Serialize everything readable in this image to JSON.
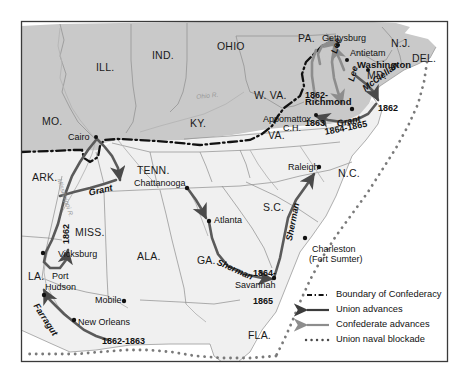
{
  "figure": {
    "kind": "historical-map",
    "frame_color": "#3a3a3a",
    "union_fill": "#c9c9c9",
    "confederacy_fill": "#f0f0f0",
    "arrow_color": "#4a4a4a",
    "water_color": "#ffffff",
    "border_color": "#7d7d7d",
    "text_color": "#111111"
  },
  "states": [
    {
      "id": "il",
      "label": "ILL.",
      "x": 96,
      "y": 62,
      "size": "lg"
    },
    {
      "id": "in",
      "label": "IND.",
      "x": 152,
      "y": 50,
      "size": "lg"
    },
    {
      "id": "oh",
      "label": "OHIO",
      "x": 217,
      "y": 41,
      "size": "lg"
    },
    {
      "id": "pa",
      "label": "PA.",
      "x": 298,
      "y": 33,
      "size": "lg"
    },
    {
      "id": "nj",
      "label": "N.J.",
      "x": 391,
      "y": 38,
      "size": "lg"
    },
    {
      "id": "del",
      "label": "DEL.",
      "x": 412,
      "y": 53,
      "size": "lg"
    },
    {
      "id": "md",
      "label": "MD.",
      "x": 367,
      "y": 70,
      "size": "lg"
    },
    {
      "id": "mo",
      "label": "MO.",
      "x": 42,
      "y": 116,
      "size": "lg"
    },
    {
      "id": "ky",
      "label": "KY.",
      "x": 190,
      "y": 118,
      "size": "lg"
    },
    {
      "id": "wva",
      "label": "W. VA.",
      "x": 254,
      "y": 90,
      "size": "lg"
    },
    {
      "id": "va",
      "label": "VA.",
      "x": 268,
      "y": 130,
      "size": "lg"
    },
    {
      "id": "ark",
      "label": "ARK.",
      "x": 32,
      "y": 172,
      "size": "lg"
    },
    {
      "id": "tenn",
      "label": "TENN.",
      "x": 137,
      "y": 165,
      "size": "lg"
    },
    {
      "id": "nc",
      "label": "N.C.",
      "x": 338,
      "y": 168,
      "size": "lg"
    },
    {
      "id": "sc",
      "label": "S.C.",
      "x": 263,
      "y": 202,
      "size": "lg"
    },
    {
      "id": "miss",
      "label": "MISS.",
      "x": 75,
      "y": 227,
      "size": "lg"
    },
    {
      "id": "ala",
      "label": "ALA.",
      "x": 137,
      "y": 251,
      "size": "lg"
    },
    {
      "id": "ga",
      "label": "GA.",
      "x": 197,
      "y": 255,
      "size": "lg"
    },
    {
      "id": "la",
      "label": "LA.",
      "x": 28,
      "y": 271,
      "size": "lg"
    },
    {
      "id": "fla",
      "label": "FLA.",
      "x": 248,
      "y": 330,
      "size": "lg"
    }
  ],
  "cities": [
    {
      "id": "gettysburg",
      "label": "Gettysburg",
      "x": 322,
      "y": 34,
      "dot_x": 338,
      "dot_y": 45,
      "bold": false
    },
    {
      "id": "antietam",
      "label": "Antietam",
      "x": 350,
      "y": 49,
      "dot_x": 347,
      "dot_y": 60,
      "bold": false
    },
    {
      "id": "washington",
      "label": "Washington",
      "x": 357,
      "y": 60,
      "dot_x": 368,
      "dot_y": 70,
      "bold": true
    },
    {
      "id": "richmond",
      "label": "Richmond",
      "x": 305,
      "y": 97,
      "dot_x": 352,
      "dot_y": 109,
      "bold": true
    },
    {
      "id": "appomattox",
      "label": "Appomattox",
      "x": 263,
      "y": 115,
      "dot_x": 316,
      "dot_y": 115,
      "bold": false
    },
    {
      "id": "appomattox_ch",
      "label": "C.H.",
      "x": 283,
      "y": 124,
      "dot_x": null,
      "dot_y": null,
      "bold": false
    },
    {
      "id": "cairo",
      "label": "Cairo",
      "x": 68,
      "y": 133,
      "dot_x": 96,
      "dot_y": 137,
      "bold": false
    },
    {
      "id": "raleigh",
      "label": "Raleigh",
      "x": 288,
      "y": 163,
      "dot_x": 319,
      "dot_y": 167,
      "bold": false
    },
    {
      "id": "chattanooga",
      "label": "Chattanooga",
      "x": 134,
      "y": 179,
      "dot_x": 187,
      "dot_y": 188,
      "bold": false
    },
    {
      "id": "atlanta",
      "label": "Atlanta",
      "x": 214,
      "y": 216,
      "dot_x": 209,
      "dot_y": 221,
      "bold": false
    },
    {
      "id": "charleston",
      "label": "Charleston",
      "x": 312,
      "y": 245,
      "dot_x": 305,
      "dot_y": 238,
      "bold": false
    },
    {
      "id": "fortsumter",
      "label": "(Fort Sumter)",
      "x": 309,
      "y": 255,
      "dot_x": null,
      "dot_y": null,
      "bold": false
    },
    {
      "id": "vicksburg",
      "label": "Vicksburg",
      "x": 58,
      "y": 250,
      "dot_x": 43,
      "dot_y": 253,
      "bold": false
    },
    {
      "id": "porthudson1",
      "label": "Port",
      "x": 52,
      "y": 272,
      "dot_x": null,
      "dot_y": null,
      "bold": false
    },
    {
      "id": "porthudson2",
      "label": "Hudson",
      "x": 45,
      "y": 283,
      "dot_x": 44,
      "dot_y": 295,
      "bold": false
    },
    {
      "id": "savannah",
      "label": "Savannah",
      "x": 235,
      "y": 281,
      "dot_x": 274,
      "dot_y": 278,
      "bold": false
    },
    {
      "id": "mobile",
      "label": "Mobile",
      "x": 95,
      "y": 296,
      "dot_x": 124,
      "dot_y": 301,
      "bold": false
    },
    {
      "id": "neworleans",
      "label": "New Orleans",
      "x": 78,
      "y": 318,
      "dot_x": 74,
      "dot_y": 320,
      "bold": false
    }
  ],
  "commanders": [
    {
      "id": "lee",
      "label": "Lee",
      "x": 330,
      "y": 52,
      "rot": "rot-lee"
    },
    {
      "id": "lee2",
      "label": "Lee",
      "x": 347,
      "y": 80,
      "rot": "rot-lee"
    },
    {
      "id": "mcclellan",
      "label": "McClellan",
      "x": 361,
      "y": 86,
      "rot": "rot-mcc"
    },
    {
      "id": "grant_east",
      "label": "Grant",
      "x": 336,
      "y": 120,
      "rot": "rot-grant-e"
    },
    {
      "id": "grant_west",
      "label": "Grant",
      "x": 88,
      "y": 189,
      "rot": "rot-grant-w"
    },
    {
      "id": "sherman_v",
      "label": "Sherman",
      "x": 285,
      "y": 240,
      "rot": "rot-sherman-v"
    },
    {
      "id": "sherman_d",
      "label": "Sherman",
      "x": 219,
      "y": 258,
      "rot": "rot-sherman-d"
    },
    {
      "id": "farragut",
      "label": "Farragut",
      "x": 39,
      "y": 302,
      "rot": "rot-farragut"
    }
  ],
  "year_labels": [
    {
      "id": "y_va_1862_1863",
      "lines": [
        "1862-",
        "1863"
      ],
      "x": 305,
      "y": 72,
      "rot": ""
    },
    {
      "id": "y_penin_1862",
      "lines": [
        "1862"
      ],
      "x": 378,
      "y": 104,
      "rot": ""
    },
    {
      "id": "y_grant_east",
      "lines": [
        "1864-1865"
      ],
      "x": 324,
      "y": 128,
      "rot": "rot-1864e"
    },
    {
      "id": "y_vicksburg",
      "lines": [
        "1862"
      ],
      "x": 62,
      "y": 244,
      "rot": "rot-1862v"
    },
    {
      "id": "y_sherman",
      "lines": [
        "1864-",
        "1865"
      ],
      "x": 253,
      "y": 250,
      "rot": ""
    },
    {
      "id": "y_gulf",
      "lines": [
        "1862-1863"
      ],
      "x": 102,
      "y": 337,
      "rot": ""
    }
  ],
  "rivers": [
    {
      "id": "ohio_r",
      "label": "Ohio R.",
      "x": 196,
      "y": 94,
      "rot": "rot-ohio"
    },
    {
      "id": "miss_r",
      "label": "Mississippi R.",
      "x": 62,
      "y": 178,
      "rot": "rot-miss"
    }
  ],
  "legend": {
    "items": [
      {
        "id": "boundary",
        "label": "Boundary of Confederacy",
        "symbol": "dash-dot-line"
      },
      {
        "id": "union",
        "label": "Union advances",
        "symbol": "arrow-left-dark"
      },
      {
        "id": "confed",
        "label": "Confederate advances",
        "symbol": "arrow-left-gray"
      },
      {
        "id": "blockade",
        "label": "Union naval blockade",
        "symbol": "dotted-line"
      }
    ]
  }
}
